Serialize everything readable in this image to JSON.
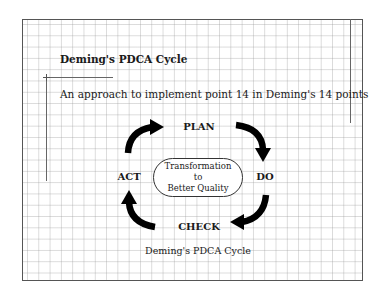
{
  "figure": {
    "title": "Deming's PDCA Cycle",
    "subtitle": "An approach to implement point 14 in Deming's 14 points",
    "caption": "Deming's PDCA Cycle"
  },
  "cycle": {
    "stages": [
      {
        "label": "PLAN"
      },
      {
        "label": "DO"
      },
      {
        "label": "CHECK"
      },
      {
        "label": "ACT"
      }
    ],
    "center": {
      "line1": "Transformation",
      "line2": "to",
      "line3": "Better Quality"
    },
    "arrow_color": "#000000",
    "arrows": [
      "curved-arrow-act-to-plan",
      "curved-arrow-plan-to-do",
      "curved-arrow-do-to-check",
      "curved-arrow-check-to-act"
    ]
  },
  "background": {
    "style": "graph-paper-grid",
    "grid_color": "#c0c0c0",
    "frame_color": "#555555"
  }
}
